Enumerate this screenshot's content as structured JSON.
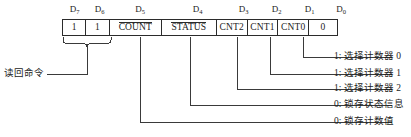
{
  "diagram": {
    "line_color": "#2b2b2b",
    "background": "#ffffff",
    "bit_headers": [
      {
        "name": "D7",
        "base": "D",
        "sub": "7"
      },
      {
        "name": "D6",
        "base": "D",
        "sub": "6"
      },
      {
        "name": "D5",
        "base": "D",
        "sub": "5"
      },
      {
        "name": "D4",
        "base": "D",
        "sub": "4"
      },
      {
        "name": "D3",
        "base": "D",
        "sub": "3"
      },
      {
        "name": "D2",
        "base": "D",
        "sub": "2"
      },
      {
        "name": "D1",
        "base": "D",
        "sub": "1"
      },
      {
        "name": "D0",
        "base": "D",
        "sub": "0"
      }
    ],
    "cells": [
      {
        "bit": "D7",
        "value": "1",
        "overline": false
      },
      {
        "bit": "D6",
        "value": "1",
        "overline": false
      },
      {
        "bit": "D5",
        "value": "COUNT",
        "overline": true
      },
      {
        "bit": "D4",
        "value": "STATUS",
        "overline": true
      },
      {
        "bit": "D3",
        "value": "CNT2",
        "overline": false
      },
      {
        "bit": "D2",
        "value": "CNT1",
        "overline": false
      },
      {
        "bit": "D1",
        "value": "CNT0",
        "overline": false
      },
      {
        "bit": "D0",
        "value": "0",
        "overline": false
      }
    ],
    "left_annotation": {
      "label": "读回命令",
      "spans_bits": "D7-D6"
    },
    "right_annotations": [
      {
        "source_bit": "D1",
        "label": "1: 选择计数器 0"
      },
      {
        "source_bit": "D2",
        "label": "1: 选择计数器 1"
      },
      {
        "source_bit": "D3",
        "label": "1: 选择计数器 2"
      },
      {
        "source_bit": "D4",
        "label": "0: 锁存状态信息"
      },
      {
        "source_bit": "D5",
        "label": "0: 锁存计数值"
      }
    ]
  }
}
